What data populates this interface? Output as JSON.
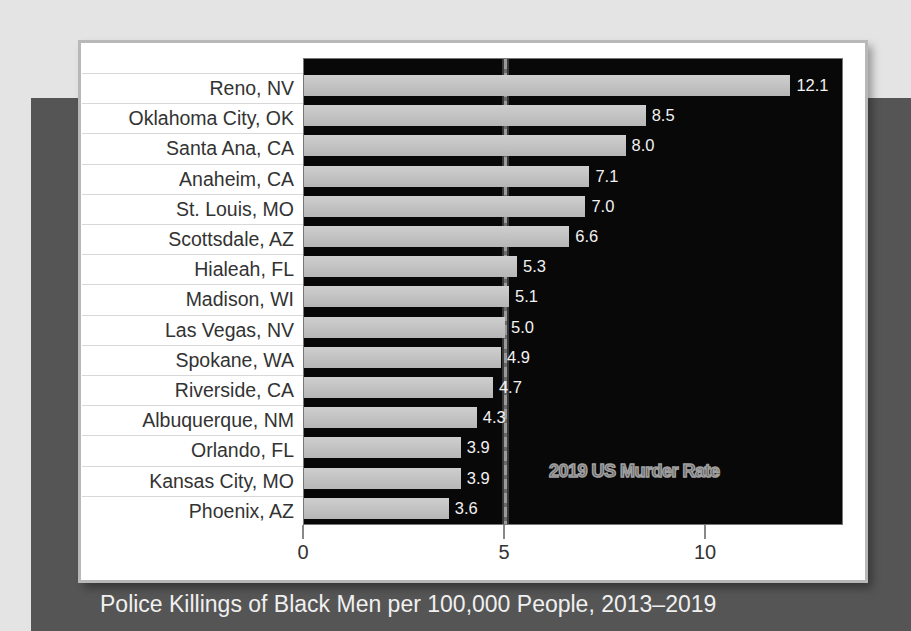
{
  "chart_data": {
    "type": "bar",
    "orientation": "horizontal",
    "title": "Police Killings of Black Men per 100,000 People, 2013–2019",
    "xlabel": "Police Killings of Black Men per 100,000 People, 2013–2019",
    "ylabel": "",
    "categories": [
      "Reno, NV",
      "Oklahoma City, OK",
      "Santa Ana, CA",
      "Anaheim, CA",
      "St. Louis, MO",
      "Scottsdale, AZ",
      "Hialeah, FL",
      "Madison, WI",
      "Las Vegas, NV",
      "Spokane, WA",
      "Riverside, CA",
      "Albuquerque, NM",
      "Orlando, FL",
      "Kansas City, MO",
      "Phoenix, AZ"
    ],
    "values": [
      12.1,
      8.5,
      8.0,
      7.1,
      7.0,
      6.6,
      5.3,
      5.1,
      5.0,
      4.9,
      4.7,
      4.3,
      3.9,
      3.9,
      3.6
    ],
    "value_labels": [
      "12.1",
      "8.5",
      "8.0",
      "7.1",
      "7.0",
      "6.6",
      "5.3",
      "5.1",
      "5.0",
      "4.9",
      "4.7",
      "4.3",
      "3.9",
      "3.9",
      "3.6"
    ],
    "xlim": [
      0,
      13.3
    ],
    "xticks": [
      0,
      5,
      10
    ],
    "xtick_labels": [
      "0",
      "5",
      "10"
    ],
    "reference_line": {
      "value": 5.0,
      "label": "2019 US Murder Rate",
      "style": "dashed"
    },
    "grid": false,
    "legend": null,
    "colors": {
      "bar": "#c4c4c4",
      "plot_background": "#080808",
      "value_label": "#f2f2f2",
      "reference_line": "#9a9a9a"
    }
  },
  "labels": {
    "caption": "Police Killings of Black Men per 100,000 People, 2013–2019",
    "reference_annotation": "2019 US Murder Rate"
  }
}
